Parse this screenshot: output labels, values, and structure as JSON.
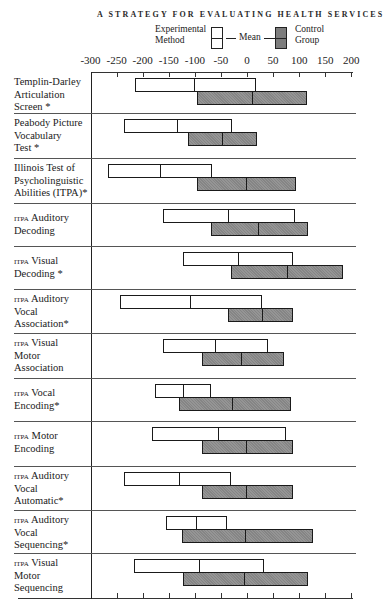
{
  "page_header": "A STRATEGY FOR EVALUATING HEALTH SERVICES",
  "legend": {
    "experimental_label_line1": "Experimental",
    "experimental_label_line2": "Method",
    "mean_label": "Mean",
    "control_label_line1": "Control",
    "control_label_line2": "Group"
  },
  "colors": {
    "experimental_fill": "#ffffff",
    "control_fill": "#8c8c8c",
    "outline": "#1a1a1a"
  },
  "chart_data": {
    "type": "bar",
    "subtype": "floating range bars with mean marker",
    "title": "",
    "xlabel": "",
    "ylabel": "",
    "xlim": [
      -300,
      200
    ],
    "x_ticks": [
      -300,
      -250,
      -200,
      -150,
      -100,
      -50,
      0,
      50,
      100,
      150,
      200
    ],
    "x_tick_labels": [
      "-300",
      "-250",
      "-200",
      "-150",
      "-100",
      "-50",
      "0",
      "50",
      "100",
      "150",
      "200"
    ],
    "legend": [
      "Experimental Method",
      "Control Group"
    ],
    "legend_position": "top",
    "grid": false,
    "categories": [
      "Templin-Darley Articulation Screen *",
      "Peabody Picture Vocabulary Test *",
      "Illinois Test of Psycholinguistic Abilities (ITPA)*",
      "ITPA Auditory Decoding",
      "ITPA Visual Decoding *",
      "ITPA Auditory Vocal Association*",
      "ITPA Visual Motor Association",
      "ITPA Vocal Encoding*",
      "ITPA Motor Encoding",
      "ITPA Auditory Vocal Automatic*",
      "ITPA Auditory Vocal Sequencing*",
      "ITPA Visual Motor Sequencing"
    ],
    "series": [
      {
        "name": "Experimental Method",
        "low": [
          -215,
          -236,
          -266,
          -161,
          -123,
          -243,
          -161,
          -176,
          -182,
          -236,
          -155,
          -216
        ],
        "mean": [
          -101,
          -134,
          -167,
          -35,
          -17,
          -109,
          -61,
          -123,
          -55,
          -130,
          -98,
          -92
        ],
        "high": [
          17,
          -29,
          -67,
          92,
          88,
          29,
          40,
          -69,
          75,
          -31,
          -38,
          33
        ]
      },
      {
        "name": "Control Group",
        "low": [
          -96,
          -113,
          -96,
          -69,
          -31,
          -36,
          -86,
          -130,
          -86,
          -86,
          -125,
          -123
        ],
        "mean": [
          11,
          -46,
          0,
          23,
          77,
          29,
          -10,
          -27,
          0,
          0,
          -2,
          -4
        ],
        "high": [
          115,
          19,
          94,
          117,
          184,
          88,
          71,
          84,
          88,
          88,
          126,
          117
        ]
      }
    ]
  },
  "rows": [
    {
      "l1": "Templin-Darley",
      "l2": "Articulation",
      "l3": "Screen *"
    },
    {
      "l1": "Peabody Picture",
      "l2": "Vocabulary",
      "l3": "Test *"
    },
    {
      "l1": "Illinois Test of",
      "l2": "Psycholinguistic",
      "l3": "Abilities (ITPA)*"
    },
    {
      "l1a": "ITPA",
      "l1b": " Auditory",
      "l2": "Decoding"
    },
    {
      "l1a": "ITPA",
      "l1b": " Visual",
      "l2": "Decoding *"
    },
    {
      "l1a": "ITPA",
      "l1b": " Auditory",
      "l2": "Vocal",
      "l3": "Association*"
    },
    {
      "l1a": "ITPA",
      "l1b": " Visual",
      "l2": "Motor",
      "l3": "Association"
    },
    {
      "l1a": "ITPA",
      "l1b": " Vocal",
      "l2": "Encoding*"
    },
    {
      "l1a": "ITPA",
      "l1b": " Motor",
      "l2": "Encoding"
    },
    {
      "l1a": "ITPA",
      "l1b": "  Auditory",
      "l2": "Vocal",
      "l3": "Automatic*"
    },
    {
      "l1a": "ITPA",
      "l1b": " Auditory",
      "l2": "Vocal",
      "l3": "Sequencing*"
    },
    {
      "l1a": "ITPA",
      "l1b": " Visual",
      "l2": "Motor",
      "l3": "Sequencing"
    }
  ]
}
